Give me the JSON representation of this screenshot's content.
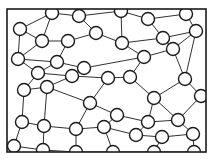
{
  "diagram": {
    "type": "node-link foam diagram",
    "frame": {
      "x": 7,
      "y": 9,
      "width": 199,
      "height": 143
    },
    "stroke_color": "#1a1a1a",
    "fill_color": "#ffffff",
    "node_radius": 6.5,
    "nodes": [
      [
        52,
        13
      ],
      [
        79,
        16
      ],
      [
        121,
        11
      ],
      [
        148,
        19
      ],
      [
        186,
        14
      ],
      [
        20,
        29
      ],
      [
        96,
        33
      ],
      [
        42,
        41
      ],
      [
        68,
        41
      ],
      [
        122,
        43
      ],
      [
        163,
        38
      ],
      [
        196,
        31
      ],
      [
        18,
        59
      ],
      [
        57,
        62
      ],
      [
        84,
        68
      ],
      [
        144,
        57
      ],
      [
        173,
        49
      ],
      [
        130,
        77
      ],
      [
        38,
        73
      ],
      [
        72,
        76
      ],
      [
        108,
        78
      ],
      [
        185,
        79
      ],
      [
        154,
        98
      ],
      [
        24,
        90
      ],
      [
        47,
        87
      ],
      [
        90,
        103
      ],
      [
        117,
        115
      ],
      [
        148,
        122
      ],
      [
        178,
        120
      ],
      [
        201,
        96
      ],
      [
        22,
        122
      ],
      [
        44,
        126
      ],
      [
        76,
        129
      ],
      [
        104,
        127
      ],
      [
        136,
        135
      ],
      [
        162,
        137
      ],
      [
        193,
        134
      ],
      [
        14,
        146
      ],
      [
        43,
        150
      ],
      [
        76,
        152
      ],
      [
        113,
        152
      ],
      [
        154,
        152
      ],
      [
        194,
        152
      ]
    ],
    "edges": [
      [
        0,
        1
      ],
      [
        0,
        5
      ],
      [
        0,
        7
      ],
      [
        1,
        2
      ],
      [
        1,
        6
      ],
      [
        2,
        3
      ],
      [
        2,
        9
      ],
      [
        3,
        4
      ],
      [
        3,
        10
      ],
      [
        4,
        11
      ],
      [
        5,
        7
      ],
      [
        5,
        12
      ],
      [
        6,
        8
      ],
      [
        6,
        9
      ],
      [
        7,
        8
      ],
      [
        7,
        12
      ],
      [
        8,
        13
      ],
      [
        9,
        10
      ],
      [
        9,
        15
      ],
      [
        10,
        11
      ],
      [
        10,
        16
      ],
      [
        11,
        16
      ],
      [
        11,
        21
      ],
      [
        12,
        13
      ],
      [
        12,
        18
      ],
      [
        13,
        14
      ],
      [
        13,
        18
      ],
      [
        14,
        19
      ],
      [
        14,
        15
      ],
      [
        15,
        16
      ],
      [
        15,
        17
      ],
      [
        16,
        21
      ],
      [
        17,
        20
      ],
      [
        17,
        22
      ],
      [
        18,
        19
      ],
      [
        18,
        23
      ],
      [
        19,
        20
      ],
      [
        19,
        24
      ],
      [
        20,
        25
      ],
      [
        21,
        22
      ],
      [
        21,
        29
      ],
      [
        22,
        27
      ],
      [
        22,
        28
      ],
      [
        23,
        24
      ],
      [
        23,
        30
      ],
      [
        24,
        25
      ],
      [
        24,
        31
      ],
      [
        25,
        26
      ],
      [
        25,
        32
      ],
      [
        26,
        27
      ],
      [
        26,
        33
      ],
      [
        27,
        28
      ],
      [
        27,
        34
      ],
      [
        28,
        29
      ],
      [
        28,
        36
      ],
      [
        30,
        31
      ],
      [
        30,
        37
      ],
      [
        31,
        32
      ],
      [
        31,
        38
      ],
      [
        32,
        33
      ],
      [
        32,
        39
      ],
      [
        33,
        34
      ],
      [
        33,
        40
      ],
      [
        34,
        35
      ],
      [
        35,
        36
      ],
      [
        35,
        41
      ],
      [
        36,
        42
      ],
      [
        37,
        38
      ],
      [
        38,
        39
      ],
      [
        39,
        40
      ],
      [
        40,
        41
      ],
      [
        41,
        42
      ]
    ]
  }
}
